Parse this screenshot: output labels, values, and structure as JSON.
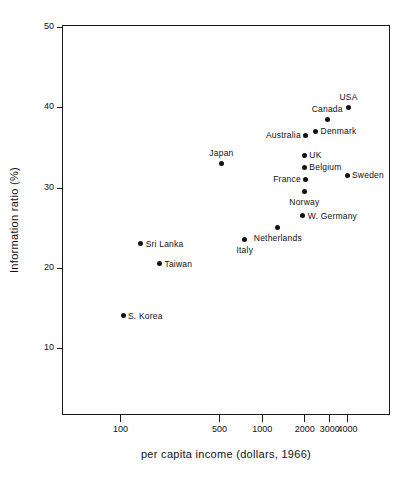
{
  "chart_data": {
    "type": "scatter",
    "title": "",
    "xlabel": "per capita income (dollars, 1966)",
    "ylabel": "Information ratio (%)",
    "xscale": "log",
    "yscale": "linear",
    "xlim": [
      70,
      6000
    ],
    "ylim": [
      5,
      50
    ],
    "grid": false,
    "legend": null,
    "xticks": [
      100,
      500,
      1000,
      2000,
      3000,
      4000
    ],
    "xtick_labels": [
      "100",
      "500",
      "1000",
      "2000",
      "3000",
      "4000"
    ],
    "yticks": [
      10,
      20,
      30,
      40,
      50
    ],
    "ytick_labels": [
      "10",
      "20",
      "30",
      "40",
      "50"
    ],
    "points": [
      {
        "name": "S. Korea",
        "x": 105,
        "y": 14.0,
        "label_pos": "right"
      },
      {
        "name": "Sri Lanka",
        "x": 140,
        "y": 23.0,
        "label_pos": "right"
      },
      {
        "name": "Taiwan",
        "x": 190,
        "y": 20.5,
        "label_pos": "right"
      },
      {
        "name": "Japan",
        "x": 520,
        "y": 33.0,
        "label_pos": "above"
      },
      {
        "name": "Italy",
        "x": 760,
        "y": 23.5,
        "label_pos": "below"
      },
      {
        "name": "Netherlands",
        "x": 1300,
        "y": 25.0,
        "label_pos": "below"
      },
      {
        "name": "W. Germany",
        "x": 1950,
        "y": 26.5,
        "label_pos": "right"
      },
      {
        "name": "Norway",
        "x": 2000,
        "y": 29.5,
        "label_pos": "below"
      },
      {
        "name": "France",
        "x": 2050,
        "y": 31.0,
        "label_pos": "left"
      },
      {
        "name": "Belgium",
        "x": 2000,
        "y": 32.5,
        "label_pos": "right"
      },
      {
        "name": "UK",
        "x": 2000,
        "y": 34.0,
        "label_pos": "right"
      },
      {
        "name": "Australia",
        "x": 2050,
        "y": 36.5,
        "label_pos": "left"
      },
      {
        "name": "Denmark",
        "x": 2400,
        "y": 37.0,
        "label_pos": "right"
      },
      {
        "name": "Canada",
        "x": 2900,
        "y": 38.5,
        "label_pos": "above"
      },
      {
        "name": "Sweden",
        "x": 4000,
        "y": 31.5,
        "label_pos": "right"
      },
      {
        "name": "USA",
        "x": 4100,
        "y": 40.0,
        "label_pos": "above"
      }
    ]
  }
}
